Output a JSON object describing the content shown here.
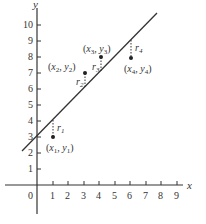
{
  "diagram": {
    "axes": {
      "x_label": "x",
      "y_label": "y",
      "origin_label": "0",
      "x_ticks": [
        "1",
        "2",
        "3",
        "4",
        "5",
        "6",
        "7",
        "8",
        "9"
      ],
      "y_ticks": [
        "1",
        "2",
        "3",
        "4",
        "5",
        "6",
        "7",
        "8",
        "9",
        "10"
      ]
    },
    "points": [
      {
        "label_x": "x",
        "sub": "1",
        "text": "(x1, y1)",
        "x": 1,
        "y": 3,
        "residual": "r",
        "residual_sub": "1"
      },
      {
        "label_x": "x",
        "sub": "2",
        "text": "(x2, y2)",
        "x": 3,
        "y": 7,
        "residual": "r",
        "residual_sub": "2"
      },
      {
        "label_x": "x",
        "sub": "3",
        "text": "(x3, y3)",
        "x": 4,
        "y": 8,
        "residual": "r",
        "residual_sub": "3"
      },
      {
        "label_x": "x",
        "sub": "4",
        "text": "(x4, y4)",
        "x": 6,
        "y": 8,
        "residual": "r",
        "residual_sub": "4"
      }
    ],
    "line": {
      "description": "fitted line",
      "approx_intercept": 2.9,
      "approx_slope": 1.0
    },
    "colors": {
      "ink": "#333333",
      "background": "#ffffff"
    }
  }
}
